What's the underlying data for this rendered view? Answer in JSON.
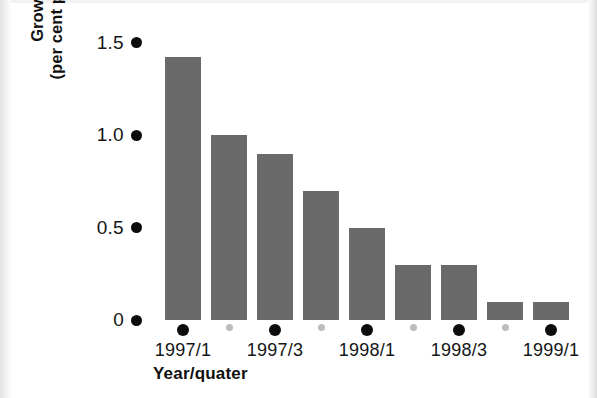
{
  "figure": {
    "background_color": "#ffffff",
    "bar_color": "#6a6a6a",
    "major_dot_color": "#0c0c0c",
    "minor_dot_color": "#bdbdbd"
  },
  "axis_titles": {
    "y_line1": "Growth rate",
    "y_line2": "(per cent per quarter)",
    "x": "Year/quater"
  },
  "chart_data": {
    "type": "bar",
    "title": "",
    "subtitle": "",
    "xlabel": "Year/quater",
    "ylabel": "Growth rate (per cent per quarter)",
    "categories": [
      "1997/1",
      "1997/2",
      "1997/3",
      "1997/4",
      "1998/1",
      "1998/2",
      "1998/3",
      "1998/4",
      "1999/1"
    ],
    "values": [
      1.42,
      1.0,
      0.9,
      0.7,
      0.5,
      0.3,
      0.3,
      0.1,
      0.1
    ],
    "ylim": [
      0,
      1.5
    ],
    "ytick_labels": [
      "1.5",
      "1.0",
      "0.5",
      "0"
    ],
    "ytick_values": [
      1.5,
      1.0,
      0.5,
      0
    ],
    "xtick_labels": [
      "1997/1",
      "1997/3",
      "1998/1",
      "1998/3",
      "1999/1"
    ],
    "xtick_labelled_indices": [
      0,
      2,
      4,
      6,
      8
    ],
    "xtick_unlabelled_indices": [
      1,
      3,
      5,
      7
    ],
    "grid": false,
    "legend": false,
    "legend_position": "none",
    "series": [
      {
        "name": "Growth rate",
        "values": [
          1.42,
          1.0,
          0.9,
          0.7,
          0.5,
          0.3,
          0.3,
          0.1,
          0.1
        ]
      }
    ]
  }
}
